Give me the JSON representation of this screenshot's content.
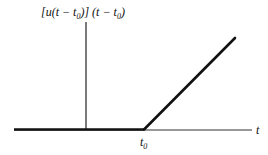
{
  "diagram": {
    "function_label": {
      "prefix": "[u(t − t",
      "sub1": "0",
      "middle": ")] (t − t",
      "sub2": "0",
      "suffix": ")"
    },
    "x_axis_label": "t",
    "t0_label": {
      "main": "t",
      "sub": "0"
    },
    "colors": {
      "line": "#111111",
      "axis": "#333333",
      "background": "#ffffff"
    },
    "geometry": {
      "x_axis": {
        "x1": 14,
        "x2": 252,
        "y": 130
      },
      "y_axis": {
        "x": 86,
        "y1": 22,
        "y2": 130
      },
      "signal_flat": {
        "x1": 14,
        "x2": 144,
        "y": 129.5
      },
      "signal_ramp": {
        "x1": 144,
        "y1": 129.5,
        "x2": 235,
        "y2": 38
      }
    }
  }
}
